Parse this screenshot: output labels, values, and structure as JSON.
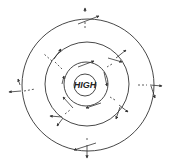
{
  "diagram": {
    "center_label": "HIGH",
    "line_color": "#333333",
    "background": "#ffffff",
    "isobars": [
      {
        "name": "outer",
        "r": 65
      },
      {
        "name": "middle",
        "r": 42
      },
      {
        "name": "inner",
        "r": 22
      },
      {
        "name": "core",
        "r": 11
      }
    ],
    "wind_vectors_count": 12
  }
}
